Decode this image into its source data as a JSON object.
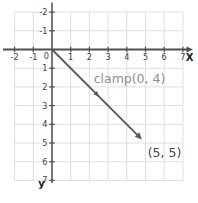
{
  "chart_data": {
    "type": "line",
    "title": "",
    "xlabel": "X",
    "ylabel": "y",
    "x_ticks": [
      -2,
      -1,
      0,
      1,
      2,
      3,
      4,
      5,
      6,
      7
    ],
    "y_ticks": [
      -2,
      -1,
      1,
      2,
      3,
      4,
      5,
      6,
      7
    ],
    "origin_label": "0",
    "y_axis_direction": "down",
    "xlim": [
      -2.7,
      7.5
    ],
    "ylim": [
      -2.5,
      7.3
    ],
    "grid": true,
    "legend": "none",
    "series": [
      {
        "name": "clamp(0, 4)",
        "style": "vector-arrow",
        "points": [
          [
            0,
            0
          ],
          [
            5,
            5
          ]
        ]
      }
    ],
    "annotation": "clamp(0, 4)",
    "endpoint_label": "(5, 5)",
    "colors": {
      "grid": "#dedede",
      "axis": "#4f4f4f",
      "tick_label": "#3f3f3f",
      "vector": "#585858",
      "annotation": "#8f8f8f",
      "endpoint_label": "#474747",
      "background": "#ffffff"
    }
  }
}
